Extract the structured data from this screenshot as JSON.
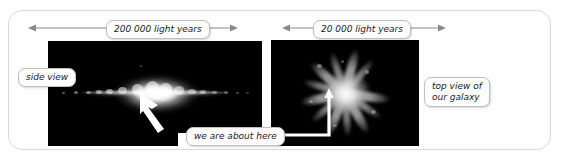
{
  "figure": {
    "title_absent": true,
    "background_color": "#ffffff",
    "frame_border_color": "#d8d8d8",
    "panel_background": "#000000"
  },
  "dimensions": [
    {
      "id": "side-view-width",
      "label": "200 000 light years",
      "arrow_style": "double-headed",
      "position": "above-left-panel"
    },
    {
      "id": "top-view-width",
      "label": "20 000 light years",
      "arrow_style": "double-headed",
      "position": "above-right-panel"
    }
  ],
  "callouts": [
    {
      "id": "side-view",
      "label": "side view"
    },
    {
      "id": "we-are-here",
      "label": "we are about here"
    },
    {
      "id": "top-view",
      "label": "top view of\nour galaxy"
    }
  ],
  "panels": [
    {
      "id": "side-view-panel",
      "view": "edge-on",
      "description": "edge-on photograph of the Milky Way galaxy disk",
      "pointer": "white-arrow"
    },
    {
      "id": "top-view-panel",
      "view": "face-on",
      "description": "face-on spiral view of our galaxy",
      "pointer": "white-elbow-pointer"
    }
  ],
  "icons": {
    "arrow_left": "arrow-left-icon",
    "arrow_right": "arrow-right-icon",
    "pointer_arrow": "pointer-arrow-icon"
  }
}
